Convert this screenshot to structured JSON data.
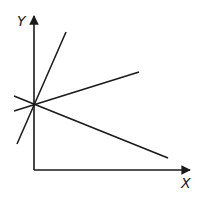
{
  "diagram": {
    "axes": {
      "y_label": "Y",
      "x_label": "X",
      "origin": [
        34,
        170
      ],
      "y_axis_top": [
        34,
        16
      ],
      "x_axis_right": [
        190,
        170
      ],
      "color": "#1a1a1a"
    },
    "intersection_point": [
      34,
      104
    ],
    "lines": [
      {
        "name": "steep-positive-line",
        "from": [
          17,
          144
        ],
        "to": [
          66,
          32
        ]
      },
      {
        "name": "shallow-positive-line",
        "from": [
          14,
          111
        ],
        "to": [
          139,
          72
        ]
      },
      {
        "name": "negative-slope-line",
        "from": [
          14,
          96
        ],
        "to": [
          168,
          158
        ]
      }
    ]
  }
}
